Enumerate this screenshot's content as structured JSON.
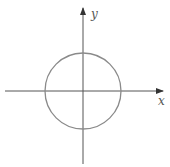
{
  "figure": {
    "type": "circle-on-axes",
    "x_axis_label": "x",
    "y_axis_label": "y",
    "colors": {
      "axis": "#555555",
      "circle": "#8a8a8a",
      "background": "#ffffff"
    }
  }
}
